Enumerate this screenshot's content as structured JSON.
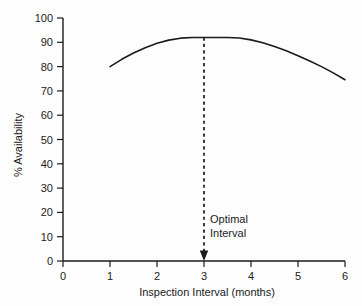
{
  "chart_data": {
    "type": "line",
    "title": "",
    "xlabel": "Inspection Interval (months)",
    "ylabel": "% Availability",
    "xlim": [
      0,
      6
    ],
    "ylim": [
      0,
      100
    ],
    "xticks": [
      0,
      1,
      2,
      3,
      4,
      5,
      6
    ],
    "yticks": [
      0,
      10,
      20,
      30,
      40,
      50,
      60,
      70,
      80,
      90,
      100
    ],
    "xtick_labels": [
      "0",
      "1",
      "2",
      "3",
      "4",
      "5",
      "6"
    ],
    "ytick_labels": [
      "0",
      "10",
      "20",
      "30",
      "40",
      "50",
      "60",
      "70",
      "80",
      "90",
      "100"
    ],
    "grid": false,
    "legend": false,
    "series": [
      {
        "name": "% Availability",
        "x": [
          1.0,
          1.25,
          1.5,
          1.75,
          2.0,
          2.25,
          2.5,
          2.75,
          3.0,
          3.25,
          3.5,
          3.75,
          4.0,
          4.25,
          4.5,
          4.75,
          5.0,
          5.25,
          5.5,
          5.75,
          6.0
        ],
        "y": [
          80.0,
          83.0,
          85.6,
          87.8,
          89.6,
          90.9,
          91.7,
          92.0,
          92.0,
          92.0,
          92.0,
          91.8,
          91.0,
          89.8,
          88.3,
          86.5,
          84.5,
          82.3,
          80.0,
          77.4,
          74.6
        ]
      }
    ],
    "annotations": [
      {
        "name": "optimal-interval-marker",
        "text_lines": [
          "Optimal",
          "Interval"
        ],
        "x": 3,
        "y_top": 92,
        "y_bottom": 0,
        "style": "dashed-arrow-down"
      }
    ],
    "colors": {
      "curve": "#1b1b1b",
      "axis": "#1b1b1b",
      "text": "#1b1b1b",
      "background": "#fdfdfd"
    }
  }
}
